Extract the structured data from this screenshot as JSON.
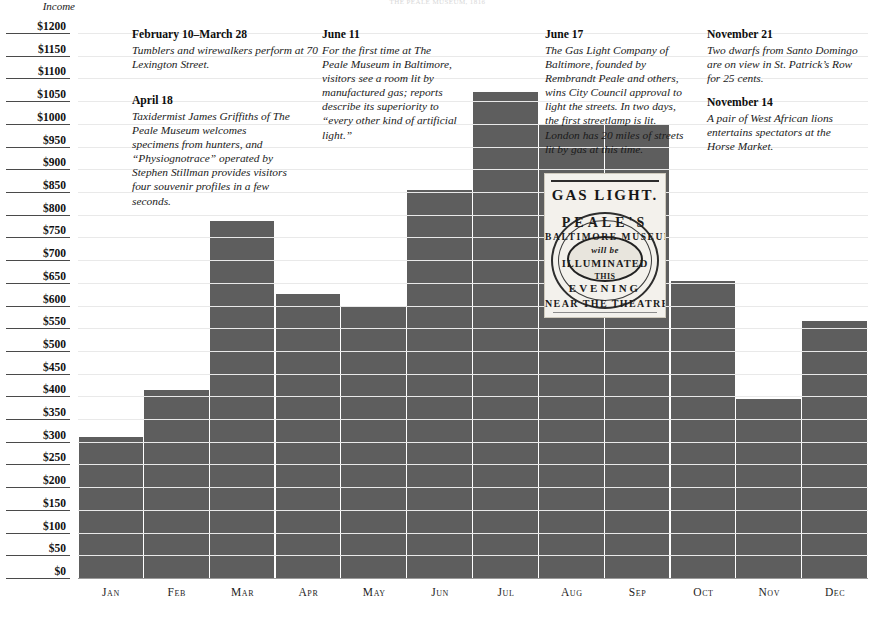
{
  "top_caption": "THE PEALE MUSEUM, 1816",
  "axis": {
    "y_title": "Income",
    "y_ticks": [
      "$1200",
      "$1150",
      "$1100",
      "$1050",
      "$1000",
      "$950",
      "$900",
      "$850",
      "$800",
      "$750",
      "$700",
      "$650",
      "$600",
      "$550",
      "$500",
      "$450",
      "$400",
      "$350",
      "$300",
      "$250",
      "$200",
      "$150",
      "$100",
      "$50",
      "$0"
    ],
    "x_ticks": [
      "Jan",
      "Feb",
      "Mar",
      "Apr",
      "May",
      "Jun",
      "Jul",
      "Aug",
      "Sep",
      "Oct",
      "Nov",
      "Dec"
    ]
  },
  "colors": {
    "bar": "#5e5e5e",
    "gridline": "#e9e9e9",
    "tick_rule": "#4a4a4a",
    "text": "#141414",
    "inset_paper": "#f3f1ec"
  },
  "chart_data": {
    "type": "bar",
    "title": "Income",
    "xlabel": "",
    "ylabel": "Income",
    "ylim": [
      0,
      1200
    ],
    "y_tick_step": 50,
    "grid": true,
    "legend": "none",
    "categories": [
      "Jan",
      "Feb",
      "Mar",
      "Apr",
      "May",
      "Jun",
      "Jul",
      "Aug",
      "Sep",
      "Oct",
      "Nov",
      "Dec"
    ],
    "values": [
      310,
      415,
      785,
      625,
      600,
      855,
      1070,
      1000,
      1000,
      655,
      395,
      565
    ],
    "units": "dollars"
  },
  "notes": [
    {
      "title": "February 10–March 28",
      "body": "Tumblers and wirewalkers perform at 70 Lexington Street."
    },
    {
      "title": "April 18",
      "body": "Taxidermist James Griffiths of The Peale Museum welcomes specimens from hunters, and “Physiognotrace” operated by Stephen Stillman provides visitors four souvenir profiles in a few seconds."
    },
    {
      "title": "June 11",
      "body": "For the first time at The Peale Museum in Baltimore, visitors see a room lit by manufactured gas; reports describe its superiority to “every other kind of artificial light.”"
    },
    {
      "title": "June 17",
      "body": "The Gas Light Company of Baltimore, founded by Rembrandt Peale and others, wins City Council approval to light the streets. In two days, the first streetlamp is lit. London has 20 miles of streets lit by gas at this time."
    },
    {
      "title": "November 21",
      "body": "Two dwarfs from Santo Domingo are on view in St. Patrick’s Row for 25 cents."
    },
    {
      "title": "November 14",
      "body": "A pair of West African lions entertains spectators at the Horse Market."
    }
  ],
  "broadside": {
    "heading": "GAS LIGHT.",
    "line1": "PEALE'S",
    "line2": "BALTIMORE MUSEUM",
    "line3": "will be",
    "line4": "ILLUMINATED",
    "line5": "THIS",
    "line6": "EVENING",
    "line7": "NEAR THE THEATRE"
  }
}
